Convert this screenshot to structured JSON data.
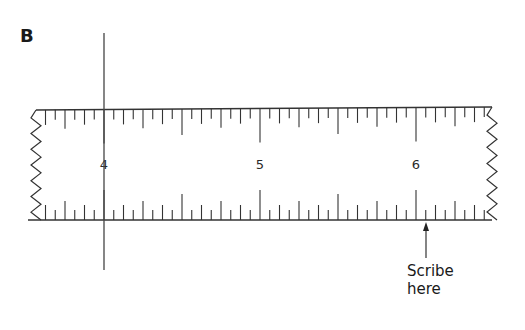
{
  "figure": {
    "label": "B"
  },
  "ruler": {
    "numbers": [
      {
        "value": "4",
        "x": 104
      },
      {
        "value": "5",
        "x": 260
      },
      {
        "value": "6",
        "x": 416
      }
    ],
    "divisions_per_unit": 16,
    "unit_px": 156,
    "start_x": 36,
    "end_x": 492,
    "top_y_left": 110,
    "top_y_right": 107,
    "bottom_y": 220,
    "line_color": "#333333"
  },
  "vertical_line": {
    "x": 104,
    "y_top": 33,
    "y_bottom": 270
  },
  "arrow": {
    "x": 426,
    "y_tail": 258,
    "y_head": 222
  },
  "callout": {
    "line1": "Scribe",
    "line2": "here"
  }
}
